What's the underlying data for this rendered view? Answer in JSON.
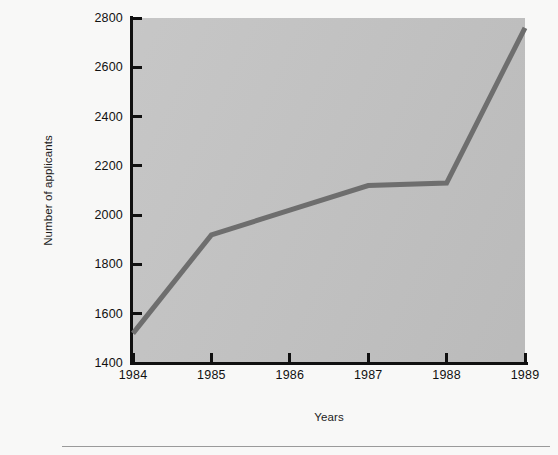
{
  "chart_data": {
    "type": "line",
    "title": "",
    "xlabel": "Years",
    "ylabel": "Number of applicants",
    "categories": [
      "1984",
      "1985",
      "1986",
      "1987",
      "1988",
      "1989"
    ],
    "x": [
      1984,
      1985,
      1986,
      1987,
      1988,
      1989
    ],
    "values": [
      1520,
      1920,
      2020,
      2120,
      2130,
      2760
    ],
    "series": [
      {
        "name": "Number of applicants",
        "values": [
          1520,
          1920,
          2020,
          2120,
          2130,
          2760
        ]
      }
    ],
    "xlim": [
      1984,
      1989
    ],
    "ylim": [
      1400,
      2800
    ],
    "y_ticks": [
      1400,
      1600,
      1800,
      2000,
      2200,
      2400,
      2600,
      2800
    ],
    "y_tick_labels": [
      "1400",
      "1600",
      "1800",
      "2000",
      "2200",
      "2400",
      "2600",
      "2800"
    ],
    "x_ticks": [
      1984,
      1985,
      1986,
      1987,
      1988,
      1989
    ],
    "x_tick_labels": [
      "1984",
      "1985",
      "1986",
      "1987",
      "1988",
      "1989"
    ],
    "grid": false,
    "legend": false,
    "legend_position": "none",
    "line_color": "#6e6e6e",
    "line_width": 5,
    "plot_background_color": "#c3c3c3",
    "axis_color": "#101010",
    "page_background_color": "#f8f8f7",
    "text_color": "#1a1a1a",
    "rule_color": "#9a9a9a"
  }
}
